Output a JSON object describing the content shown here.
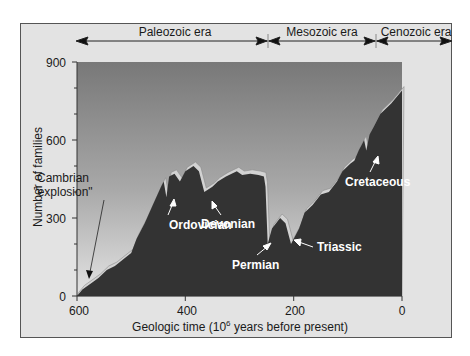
{
  "chart_data": {
    "type": "area",
    "title": "",
    "xlabel": "Geologic time (10^6 years before present)",
    "xlabel_parts": {
      "pre": "Geologic time (10",
      "sup": "6",
      "post": " years before present)"
    },
    "ylabel": "Number of families",
    "x_ticks": [
      600,
      400,
      200,
      0
    ],
    "y_ticks": [
      0,
      300,
      600,
      900
    ],
    "xlim": [
      600,
      0
    ],
    "ylim": [
      0,
      900
    ],
    "grid": false,
    "eras": [
      {
        "name": "Paleozoic era",
        "start": 600,
        "end": 245
      },
      {
        "name": "Mesozoic era",
        "start": 245,
        "end": 65
      },
      {
        "name": "Cenozoic era",
        "start": 65,
        "end": 0
      }
    ],
    "series": [
      {
        "name": "Marine families",
        "x": [
          600,
          590,
          570,
          560,
          545,
          530,
          515,
          500,
          490,
          475,
          460,
          445,
          440,
          435,
          430,
          420,
          410,
          400,
          385,
          375,
          365,
          350,
          340,
          325,
          305,
          295,
          280,
          265,
          255,
          252,
          248,
          240,
          225,
          215,
          205,
          190,
          180,
          165,
          150,
          135,
          120,
          110,
          95,
          88,
          80,
          70,
          66,
          60,
          50,
          40,
          20,
          0
        ],
        "values": [
          0,
          25,
          55,
          70,
          100,
          115,
          140,
          165,
          220,
          280,
          350,
          420,
          440,
          380,
          460,
          470,
          440,
          480,
          500,
          480,
          400,
          420,
          440,
          460,
          480,
          465,
          470,
          465,
          460,
          420,
          200,
          260,
          300,
          280,
          200,
          260,
          320,
          350,
          390,
          400,
          440,
          480,
          510,
          520,
          560,
          600,
          560,
          620,
          660,
          700,
          740,
          790
        ]
      }
    ],
    "annotations": [
      {
        "text": "Cambrian",
        "x": 560,
        "y": 420
      },
      {
        "text": "\"explosion\"",
        "x": 560,
        "y": 380
      },
      {
        "text": "Ordovician",
        "x": 440,
        "y": 280
      },
      {
        "text": "Devonian",
        "x": 365,
        "y": 280
      },
      {
        "text": "Permian",
        "x": 248,
        "y": 100
      },
      {
        "text": "Triassic",
        "x": 205,
        "y": 170
      },
      {
        "text": "Cretaceous",
        "x": 66,
        "y": 430
      }
    ]
  },
  "labels": {
    "era_paleozoic": "Paleozoic era",
    "era_mesozoic": "Mesozoic era",
    "era_cenozoic": "Cenozoic era",
    "ylabel": "Number of families",
    "xlabel_pre": "Geologic time (10",
    "xlabel_sup": "6",
    "xlabel_post": " years before present)",
    "ytick_0": "0",
    "ytick_300": "300",
    "ytick_600": "600",
    "ytick_900": "900",
    "xtick_600": "600",
    "xtick_400": "400",
    "xtick_200": "200",
    "xtick_0": "0",
    "ann_cambrian_1": "Cambrian",
    "ann_cambrian_2": "\"explosion\"",
    "ann_ordovician": "Ordovician",
    "ann_devonian": "Devonian",
    "ann_permian": "Permian",
    "ann_triassic": "Triassic",
    "ann_cretaceous": "Cretaceous"
  },
  "colors": {
    "panel": "#e3e3e3",
    "plot_top": "#7a7a7a",
    "plot_bottom": "#e0e0e0",
    "area_fill": "#333333",
    "highlight": "#cfcfcf"
  }
}
